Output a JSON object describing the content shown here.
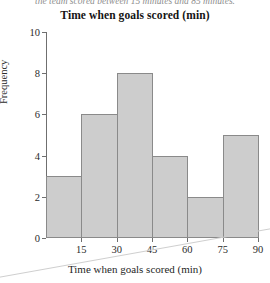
{
  "caption": {
    "text": "the team scored between 15 minutes and 85 minutes."
  },
  "chart_data": {
    "type": "bar",
    "title": "Time when goals scored (min)",
    "xlabel": "Time when goals scored (min)",
    "ylabel": "Frequency",
    "categories": [
      "0-15",
      "15-30",
      "30-45",
      "45-60",
      "60-75",
      "75-90"
    ],
    "bin_edges": [
      0,
      15,
      30,
      45,
      60,
      75,
      90
    ],
    "values": [
      3,
      6,
      8,
      4,
      2,
      5
    ],
    "xlim": [
      0,
      90
    ],
    "ylim": [
      0,
      10
    ],
    "xticks": [
      15,
      30,
      45,
      60,
      75,
      90
    ],
    "yticks": [
      0,
      2,
      4,
      6,
      8,
      10
    ],
    "grid": false,
    "legend": false,
    "bar_fill_color": "#cdcdcd",
    "bar_border_color": "#8a8a8a",
    "axis_color": "#6f6f6f"
  }
}
